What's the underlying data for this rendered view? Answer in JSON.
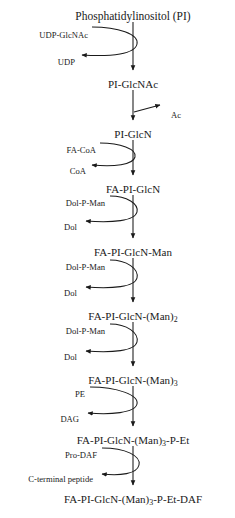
{
  "diagram": {
    "type": "biochemical-pathway",
    "title": "Phosphatidylinositol (PI)",
    "orientation": "vertical-top-to-bottom",
    "background": "#ffffff",
    "stroke": "#1a1a1a",
    "axis_x": 133,
    "nodes": [
      {
        "id": "pi",
        "label": "Phosphatidylinositol (PI)",
        "x": 133,
        "y": 10
      },
      {
        "id": "piglcnac",
        "label": "PI-GlcNAc",
        "x": 133,
        "y": 78
      },
      {
        "id": "piglcn",
        "label": "PI-GlcN",
        "x": 133,
        "y": 128
      },
      {
        "id": "faplglcn",
        "label": "FA-PI-GlcN",
        "x": 133,
        "y": 183
      },
      {
        "id": "man1",
        "label": "FA-PI-GlcN-Man",
        "x": 133,
        "y": 246
      },
      {
        "id": "man2",
        "label": "FA-PI-GlcN-(Man)",
        "sub": "2",
        "x": 133,
        "y": 310
      },
      {
        "id": "man3",
        "label": "FA-PI-GlcN-(Man)",
        "sub": "3",
        "x": 133,
        "y": 374
      },
      {
        "id": "manpet",
        "label": "FA-PI-GlcN-(Man)",
        "sub": "3",
        "suffix": "-P-Et",
        "x": 133,
        "y": 434
      },
      {
        "id": "final",
        "label": "FA-PI-GlcN-(Man)",
        "sub": "3",
        "suffix": "-P-Et-DAF",
        "x": 133,
        "y": 493
      }
    ],
    "steps": [
      {
        "id": "step-1",
        "substrate": "UDP-GlcNAc",
        "product": "UDP",
        "substrate_x": 88,
        "substrate_y": 30,
        "product_x": 75,
        "product_y": 57,
        "style": "loop"
      },
      {
        "id": "step-2",
        "substrate": null,
        "product": "Ac",
        "product_x": 171,
        "product_y": 110,
        "style": "branch"
      },
      {
        "id": "step-3",
        "substrate": "FA-CoA",
        "product": "CoA",
        "substrate_x": 96,
        "substrate_y": 145,
        "product_x": 86,
        "product_y": 166,
        "style": "loop"
      },
      {
        "id": "step-4",
        "substrate": "Dol-P-Man",
        "product": "Dol",
        "substrate_x": 105,
        "substrate_y": 198,
        "product_x": 77,
        "product_y": 222,
        "style": "loop"
      },
      {
        "id": "step-5",
        "substrate": "Dol-P-Man",
        "product": "Dol",
        "substrate_x": 105,
        "substrate_y": 262,
        "product_x": 77,
        "product_y": 288,
        "style": "loop"
      },
      {
        "id": "step-6",
        "substrate": "Dol-P-Man",
        "product": "Dol",
        "substrate_x": 105,
        "substrate_y": 326,
        "product_x": 77,
        "product_y": 352,
        "style": "loop"
      },
      {
        "id": "step-7",
        "substrate": "PE",
        "product": "DAG",
        "substrate_x": 85,
        "substrate_y": 389,
        "product_x": 79,
        "product_y": 414,
        "style": "loop"
      },
      {
        "id": "step-8",
        "substrate": "Pro-DAF",
        "product": "C-terminal peptide",
        "substrate_x": 97,
        "substrate_y": 450,
        "product_x": 93,
        "product_y": 474,
        "style": "loop"
      }
    ]
  }
}
